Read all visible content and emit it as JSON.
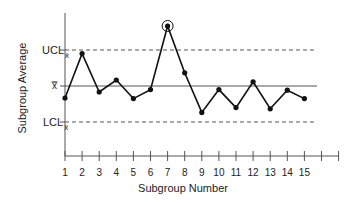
{
  "chart_data": {
    "type": "line",
    "title": "",
    "xlabel": "Subgroup Number",
    "ylabel": "Subgroup Average",
    "categories": [
      1,
      2,
      3,
      4,
      5,
      6,
      7,
      8,
      9,
      10,
      11,
      12,
      13,
      14,
      15
    ],
    "x_ticks_total": 17,
    "x_tick_labels": [
      "1",
      "2",
      "3",
      "4",
      "5",
      "6",
      "7",
      "8",
      "9",
      "10",
      "11",
      "12",
      "13",
      "14",
      "15"
    ],
    "series": [
      {
        "name": "Subgroup Average",
        "values": [
          -1.0,
          2.7,
          -0.5,
          0.5,
          -1.05,
          -0.3,
          5.0,
          1.1,
          -2.2,
          -0.3,
          -1.8,
          0.35,
          -1.9,
          -0.35,
          -1.05
        ]
      }
    ],
    "reference_lines": [
      {
        "name": "UCL",
        "label": "UCL",
        "subscript": "x̄",
        "value": 3,
        "style": "dashed"
      },
      {
        "name": "center",
        "label": "x̿",
        "value": 0,
        "style": "solid"
      },
      {
        "name": "LCL",
        "label": "LCL",
        "subscript": "x̄",
        "value": -3,
        "style": "dashed"
      }
    ],
    "annotations": [
      {
        "type": "circle",
        "point_index": 6,
        "note": "out-of-control point (subgroup 7)"
      }
    ],
    "ylim": [
      -6,
      6
    ],
    "grid": false,
    "legend": "none"
  },
  "labels": {
    "ucl": "UCL",
    "ucl_sub": "x̄",
    "center": "x̿",
    "lcl": "LCL",
    "lcl_sub": "x̄",
    "xlabel": "Subgroup Number",
    "ylabel": "Subgroup Average"
  },
  "colors": {
    "line": "#111111",
    "axis": "#555555",
    "ref": "#555555"
  }
}
